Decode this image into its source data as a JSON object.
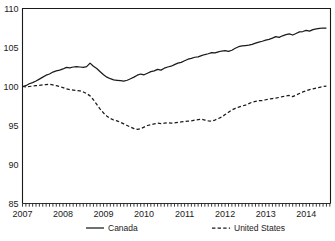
{
  "chart_data": {
    "type": "line",
    "title": "",
    "subtitle": "",
    "xlabel": "",
    "ylabel": "",
    "xlim": [
      2007.0,
      2014.6
    ],
    "ylim": [
      85,
      110
    ],
    "yticks": [
      85,
      90,
      95,
      100,
      105,
      110
    ],
    "ytick_labels": [
      "85",
      "90",
      "95",
      "100",
      "105",
      "110"
    ],
    "xticks": [
      2007,
      2008,
      2009,
      2010,
      2011,
      2012,
      2013,
      2014
    ],
    "xtick_labels": [
      "2007",
      "2008",
      "2009",
      "2010",
      "2011",
      "2012",
      "2013",
      "2014"
    ],
    "grid": false,
    "legend_position": "bottom",
    "index_base": 100,
    "minor_ticks_axis": "x",
    "series": [
      {
        "name": "Canada",
        "style": "solid",
        "color": "#1a1a1a",
        "x": [
          2007.0,
          2007.083,
          2007.167,
          2007.25,
          2007.333,
          2007.417,
          2007.5,
          2007.583,
          2007.667,
          2007.75,
          2007.833,
          2007.917,
          2008.0,
          2008.083,
          2008.167,
          2008.25,
          2008.333,
          2008.417,
          2008.5,
          2008.583,
          2008.667,
          2008.75,
          2008.833,
          2008.917,
          2009.0,
          2009.083,
          2009.167,
          2009.25,
          2009.333,
          2009.417,
          2009.5,
          2009.583,
          2009.667,
          2009.75,
          2009.833,
          2009.917,
          2010.0,
          2010.083,
          2010.167,
          2010.25,
          2010.333,
          2010.417,
          2010.5,
          2010.583,
          2010.667,
          2010.75,
          2010.833,
          2010.917,
          2011.0,
          2011.083,
          2011.167,
          2011.25,
          2011.333,
          2011.417,
          2011.5,
          2011.583,
          2011.667,
          2011.75,
          2011.833,
          2011.917,
          2012.0,
          2012.083,
          2012.167,
          2012.25,
          2012.333,
          2012.417,
          2012.5,
          2012.583,
          2012.667,
          2012.75,
          2012.833,
          2012.917,
          2013.0,
          2013.083,
          2013.167,
          2013.25,
          2013.333,
          2013.417,
          2013.5,
          2013.583,
          2013.667,
          2013.75,
          2013.833,
          2013.917,
          2014.0,
          2014.083,
          2014.167,
          2014.25,
          2014.333,
          2014.417,
          2014.5
        ],
        "values": [
          100.0,
          100.1,
          100.35,
          100.5,
          100.7,
          100.95,
          101.2,
          101.45,
          101.6,
          101.85,
          102.0,
          102.1,
          102.25,
          102.45,
          102.4,
          102.5,
          102.55,
          102.5,
          102.45,
          102.55,
          103.0,
          102.6,
          102.3,
          101.9,
          101.5,
          101.2,
          101.0,
          100.85,
          100.8,
          100.75,
          100.7,
          100.8,
          101.0,
          101.2,
          101.45,
          101.6,
          101.5,
          101.7,
          101.9,
          102.0,
          102.2,
          102.1,
          102.35,
          102.5,
          102.6,
          102.8,
          103.0,
          103.1,
          103.3,
          103.5,
          103.6,
          103.75,
          103.8,
          103.95,
          104.1,
          104.2,
          104.35,
          104.3,
          104.45,
          104.55,
          104.6,
          104.5,
          104.65,
          104.9,
          105.1,
          105.2,
          105.25,
          105.3,
          105.4,
          105.55,
          105.7,
          105.8,
          105.95,
          106.05,
          106.2,
          106.4,
          106.3,
          106.5,
          106.65,
          106.75,
          106.6,
          106.8,
          107.0,
          107.05,
          107.2,
          107.1,
          107.3,
          107.4,
          107.45,
          107.5,
          107.5
        ]
      },
      {
        "name": "United States",
        "style": "dashed",
        "color": "#1a1a1a",
        "x": [
          2007.0,
          2007.083,
          2007.167,
          2007.25,
          2007.333,
          2007.417,
          2007.5,
          2007.583,
          2007.667,
          2007.75,
          2007.833,
          2007.917,
          2008.0,
          2008.083,
          2008.167,
          2008.25,
          2008.333,
          2008.417,
          2008.5,
          2008.583,
          2008.667,
          2008.75,
          2008.833,
          2008.917,
          2009.0,
          2009.083,
          2009.167,
          2009.25,
          2009.333,
          2009.417,
          2009.5,
          2009.583,
          2009.667,
          2009.75,
          2009.833,
          2009.917,
          2010.0,
          2010.083,
          2010.167,
          2010.25,
          2010.333,
          2010.417,
          2010.5,
          2010.583,
          2010.667,
          2010.75,
          2010.833,
          2010.917,
          2011.0,
          2011.083,
          2011.167,
          2011.25,
          2011.333,
          2011.417,
          2011.5,
          2011.583,
          2011.667,
          2011.75,
          2011.833,
          2011.917,
          2012.0,
          2012.083,
          2012.167,
          2012.25,
          2012.333,
          2012.417,
          2012.5,
          2012.583,
          2012.667,
          2012.75,
          2012.833,
          2012.917,
          2013.0,
          2013.083,
          2013.167,
          2013.25,
          2013.333,
          2013.417,
          2013.5,
          2013.583,
          2013.667,
          2013.75,
          2013.833,
          2013.917,
          2014.0,
          2014.083,
          2014.167,
          2014.25,
          2014.333,
          2014.417,
          2014.5
        ],
        "values": [
          100.0,
          99.95,
          100.0,
          100.05,
          100.1,
          100.15,
          100.2,
          100.25,
          100.3,
          100.2,
          100.1,
          100.0,
          99.85,
          99.7,
          99.6,
          99.55,
          99.5,
          99.45,
          99.3,
          99.1,
          98.8,
          98.3,
          97.7,
          97.1,
          96.6,
          96.2,
          95.9,
          95.7,
          95.6,
          95.4,
          95.2,
          95.0,
          94.8,
          94.6,
          94.5,
          94.6,
          94.8,
          95.0,
          95.1,
          95.2,
          95.3,
          95.25,
          95.3,
          95.35,
          95.3,
          95.35,
          95.4,
          95.45,
          95.5,
          95.55,
          95.6,
          95.7,
          95.75,
          95.8,
          95.7,
          95.6,
          95.55,
          95.7,
          95.9,
          96.1,
          96.4,
          96.7,
          97.0,
          97.2,
          97.35,
          97.5,
          97.6,
          97.8,
          98.0,
          98.1,
          98.2,
          98.2,
          98.3,
          98.4,
          98.45,
          98.5,
          98.6,
          98.7,
          98.8,
          98.85,
          98.7,
          98.9,
          99.1,
          99.3,
          99.45,
          99.6,
          99.7,
          99.8,
          99.9,
          100.0,
          100.05
        ]
      }
    ]
  },
  "legend": {
    "items": [
      {
        "label": "Canada",
        "style": "solid"
      },
      {
        "label": "United States",
        "style": "dashed"
      }
    ]
  }
}
